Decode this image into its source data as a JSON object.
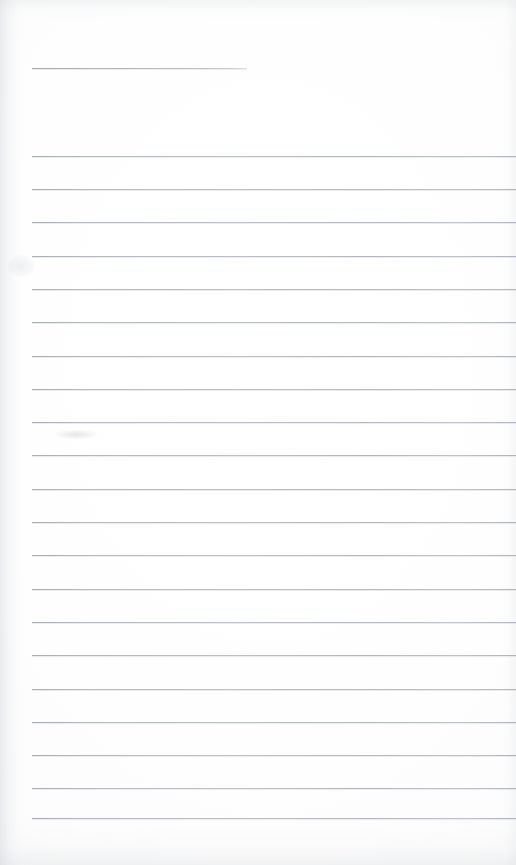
{
  "page": {
    "kind": "scanned-lined-notebook-page",
    "width": 516,
    "height": 865,
    "background_color": "#fdfdfd",
    "rule_color": "#b6bbc1",
    "text_content": "",
    "notes_visible": "none"
  },
  "layout": {
    "left_margin_x": 32,
    "right_edge_x": 516,
    "first_rule_y": 156,
    "rule_spacing": 33.1,
    "rule_count": 21,
    "bottom_margin_px": 47
  },
  "title_rule": {
    "label": "",
    "x": 32,
    "y": 68,
    "width": 215
  },
  "rules": [
    {
      "index": 1,
      "y": 156,
      "text": ""
    },
    {
      "index": 2,
      "y": 189,
      "text": ""
    },
    {
      "index": 3,
      "y": 222,
      "text": ""
    },
    {
      "index": 4,
      "y": 256,
      "text": ""
    },
    {
      "index": 5,
      "y": 289,
      "text": ""
    },
    {
      "index": 6,
      "y": 322,
      "text": ""
    },
    {
      "index": 7,
      "y": 356,
      "text": ""
    },
    {
      "index": 8,
      "y": 389,
      "text": ""
    },
    {
      "index": 9,
      "y": 422,
      "text": ""
    },
    {
      "index": 10,
      "y": 455,
      "text": ""
    },
    {
      "index": 11,
      "y": 489,
      "text": ""
    },
    {
      "index": 12,
      "y": 522,
      "text": ""
    },
    {
      "index": 13,
      "y": 555,
      "text": ""
    },
    {
      "index": 14,
      "y": 589,
      "text": ""
    },
    {
      "index": 15,
      "y": 622,
      "text": ""
    },
    {
      "index": 16,
      "y": 655,
      "text": ""
    },
    {
      "index": 17,
      "y": 689,
      "text": ""
    },
    {
      "index": 18,
      "y": 722,
      "text": ""
    },
    {
      "index": 19,
      "y": 755,
      "text": ""
    },
    {
      "index": 20,
      "y": 788,
      "text": ""
    },
    {
      "index": 21,
      "y": 818,
      "text": ""
    }
  ]
}
